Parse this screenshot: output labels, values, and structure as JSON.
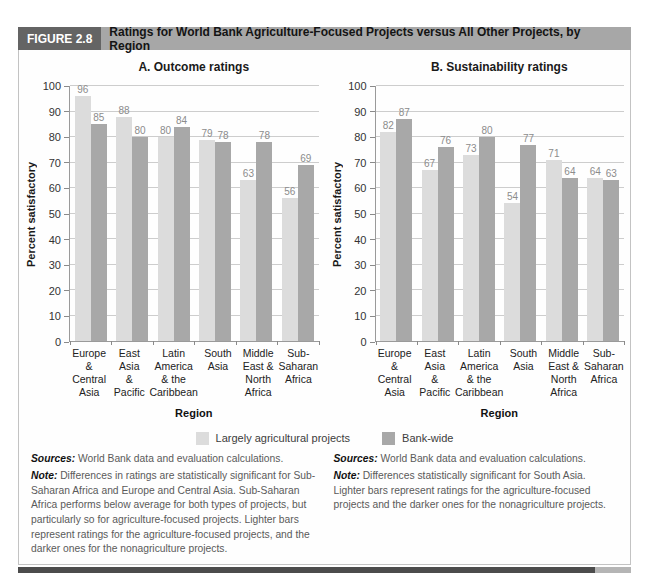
{
  "figure": {
    "label": "FIGURE 2.8",
    "title": "Ratings for World Bank Agriculture-Focused Projects versus All Other Projects, by Region"
  },
  "colors": {
    "agriculture_bar": "#dcdcdc",
    "bankwide_bar": "#a8a8a8",
    "header_label_bg": "#646464",
    "header_title_bg": "#a7a7a7",
    "gridline": "#cdcdcd",
    "value_label": "#8c8c8c",
    "bottom_rule_dark": "#4c4c4c",
    "bottom_rule_tip": "#b5b5b5"
  },
  "legend": {
    "items": [
      {
        "label": "Largely agricultural projects",
        "color": "#dcdcdc"
      },
      {
        "label": "Bank-wide",
        "color": "#a8a8a8"
      }
    ]
  },
  "chart_data": [
    {
      "type": "bar",
      "title": "A. Outcome ratings",
      "ylabel": "Percent satisfactory",
      "xlabel": "Region",
      "ylim": [
        0,
        100
      ],
      "ytick_step": 10,
      "yticks": [
        0,
        10,
        20,
        30,
        40,
        50,
        60,
        70,
        80,
        90,
        100
      ],
      "grid": true,
      "legend_position": "below-center",
      "categories": [
        "Europe & Central Asia",
        "East Asia & Pacific",
        "Latin America & the Caribbean",
        "South Asia",
        "Middle East & North Africa",
        "Sub-Saharan Africa"
      ],
      "category_lines": [
        [
          "Europe",
          "&",
          "Central",
          "Asia"
        ],
        [
          "East Asia",
          "&",
          "Pacific"
        ],
        [
          "Latin",
          "America",
          "& the",
          "Caribbean"
        ],
        [
          "South",
          "Asia"
        ],
        [
          "Middle",
          "East &",
          "North",
          "Africa"
        ],
        [
          "Sub-",
          "Saharan",
          "Africa"
        ]
      ],
      "series": [
        {
          "name": "Largely agricultural projects",
          "color": "#dcdcdc",
          "values": [
            96,
            88,
            80,
            79,
            63,
            56
          ]
        },
        {
          "name": "Bank-wide",
          "color": "#a8a8a8",
          "values": [
            85,
            80,
            84,
            78,
            78,
            69
          ]
        }
      ]
    },
    {
      "type": "bar",
      "title": "B. Sustainability ratings",
      "ylabel": "Percent satisfactory",
      "xlabel": "Region",
      "ylim": [
        0,
        100
      ],
      "ytick_step": 10,
      "yticks": [
        0,
        10,
        20,
        30,
        40,
        50,
        60,
        70,
        80,
        90,
        100
      ],
      "grid": true,
      "legend_position": "below-center",
      "categories": [
        "Europe & Central Asia",
        "East Asia & Pacific",
        "Latin America & the Caribbean",
        "South Asia",
        "Middle East & North Africa",
        "Sub-Saharan Africa"
      ],
      "category_lines": [
        [
          "Europe",
          "&",
          "Central",
          "Asia"
        ],
        [
          "East Asia",
          "&",
          "Pacific"
        ],
        [
          "Latin",
          "America",
          "& the",
          "Caribbean"
        ],
        [
          "South",
          "Asia"
        ],
        [
          "Middle",
          "East &",
          "North",
          "Africa"
        ],
        [
          "Sub-",
          "Saharan",
          "Africa"
        ]
      ],
      "series": [
        {
          "name": "Largely agricultural projects",
          "color": "#dcdcdc",
          "values": [
            82,
            67,
            73,
            54,
            71,
            64
          ]
        },
        {
          "name": "Bank-wide",
          "color": "#a8a8a8",
          "values": [
            87,
            76,
            80,
            77,
            64,
            63
          ]
        }
      ]
    }
  ],
  "footnotes": {
    "left": {
      "sources_label": "Sources:",
      "sources_text": "World Bank data and evaluation calculations.",
      "note_label": "Note:",
      "note_text": "Differences in ratings are statistically significant for Sub-Saharan Africa and Europe and Central Asia. Sub-Saharan Africa performs below average for both types of projects, but particularly so for agriculture-focused projects. Lighter bars represent ratings for the agriculture-focused projects, and the darker ones for the nonagriculture projects."
    },
    "right": {
      "sources_label": "Sources:",
      "sources_text": "World Bank data and evaluation calculations.",
      "note_label": "Note:",
      "note_text": "Differences statistically significant for South Asia. Lighter bars represent ratings for the agriculture-focused projects and the darker ones for the nonagriculture projects."
    }
  }
}
